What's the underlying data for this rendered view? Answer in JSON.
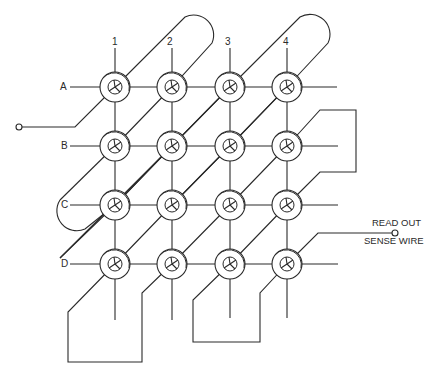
{
  "diagram": {
    "type": "magnetic-core-memory-matrix",
    "grid": {
      "rows": 4,
      "columns": 4
    },
    "column_labels": [
      "1",
      "2",
      "3",
      "4"
    ],
    "row_labels": [
      "A",
      "B",
      "C",
      "D"
    ],
    "sense_wire_label": {
      "line1": "READ OUT",
      "line2": "SENSE WIRE"
    },
    "cores": [
      {
        "row": "A",
        "col": "1"
      },
      {
        "row": "A",
        "col": "2"
      },
      {
        "row": "A",
        "col": "3"
      },
      {
        "row": "A",
        "col": "4"
      },
      {
        "row": "B",
        "col": "1"
      },
      {
        "row": "B",
        "col": "2"
      },
      {
        "row": "B",
        "col": "3"
      },
      {
        "row": "B",
        "col": "4"
      },
      {
        "row": "C",
        "col": "1"
      },
      {
        "row": "C",
        "col": "2"
      },
      {
        "row": "C",
        "col": "3"
      },
      {
        "row": "C",
        "col": "4"
      },
      {
        "row": "D",
        "col": "1"
      },
      {
        "row": "D",
        "col": "2"
      },
      {
        "row": "D",
        "col": "3"
      },
      {
        "row": "D",
        "col": "4"
      }
    ],
    "terminals": [
      "sense-wire-input-terminal",
      "read-out-terminal"
    ],
    "colors": {
      "line": "#2a2a2a",
      "background": "#ffffff"
    }
  }
}
